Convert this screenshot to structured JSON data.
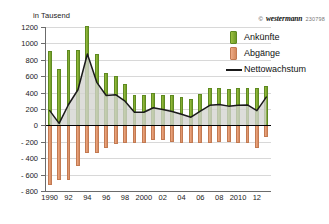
{
  "chart_data": {
    "type": "bar",
    "title": "",
    "subtitle": "",
    "axis_unit_label": "in Tausend",
    "xlabel": "",
    "ylabel": "in Tausend",
    "ylim": [
      -800,
      1200
    ],
    "y_ticks": [
      1200,
      1000,
      800,
      600,
      400,
      200,
      0,
      -200,
      -400,
      -600,
      -800
    ],
    "y_tick_labels": [
      "1200",
      "1000",
      "800",
      "600",
      "400",
      "200",
      "0",
      "- 200",
      "- 400",
      "- 600",
      "- 800"
    ],
    "grid": true,
    "legend_position": "right",
    "x": [
      1990,
      1991,
      1992,
      1993,
      1994,
      1995,
      1996,
      1997,
      1998,
      1999,
      2000,
      2001,
      2002,
      2003,
      2004,
      2005,
      2006,
      2007,
      2008,
      2009,
      2010,
      2011,
      2012,
      2013
    ],
    "categories": [
      "1990",
      "1991",
      "1992",
      "1993",
      "1994",
      "1995",
      "1996",
      "1997",
      "1998",
      "1999",
      "2000",
      "2001",
      "2002",
      "2003",
      "2004",
      "2005",
      "2006",
      "2007",
      "2008",
      "2009",
      "2010",
      "2011",
      "2012",
      "2013"
    ],
    "x_tick_labels": [
      "1990",
      "92",
      "94",
      "96",
      "98",
      "2000",
      "02",
      "04",
      "06",
      "08",
      "2010",
      "12"
    ],
    "x_tick_years": [
      1990,
      1992,
      1994,
      1996,
      1998,
      2000,
      2002,
      2004,
      2006,
      2008,
      2010,
      2012
    ],
    "series": [
      {
        "name": "Ankünfte",
        "color": "#88b135",
        "values": [
          910,
          690,
          925,
          925,
          1210,
          865,
          645,
          605,
          510,
          370,
          370,
          395,
          375,
          370,
          350,
          320,
          385,
          455,
          455,
          440,
          455,
          460,
          455,
          485
        ]
      },
      {
        "name": "Abgänge",
        "color": "#e49a72",
        "values": [
          -730,
          -665,
          -670,
          -490,
          -340,
          -340,
          -280,
          -230,
          -215,
          -210,
          -210,
          -180,
          -180,
          -200,
          -215,
          -220,
          -210,
          -210,
          -200,
          -205,
          -210,
          -210,
          -275,
          -140
        ]
      },
      {
        "name": "Nettowachstum",
        "color": "#1a1a1a",
        "values": [
          180,
          25,
          255,
          435,
          870,
          525,
          365,
          375,
          295,
          160,
          160,
          215,
          195,
          170,
          135,
          100,
          175,
          245,
          255,
          235,
          245,
          250,
          180,
          345
        ]
      }
    ]
  },
  "legend": {
    "items": [
      {
        "label": "Ankünfte",
        "marker": "bar-swatch-green"
      },
      {
        "label": "Abgänge",
        "marker": "bar-swatch-orange"
      },
      {
        "label": "Nettowachstum",
        "marker": "line-swatch-black"
      }
    ]
  },
  "logo": {
    "copyright": "©",
    "brand": "westermann",
    "code": "230798"
  }
}
